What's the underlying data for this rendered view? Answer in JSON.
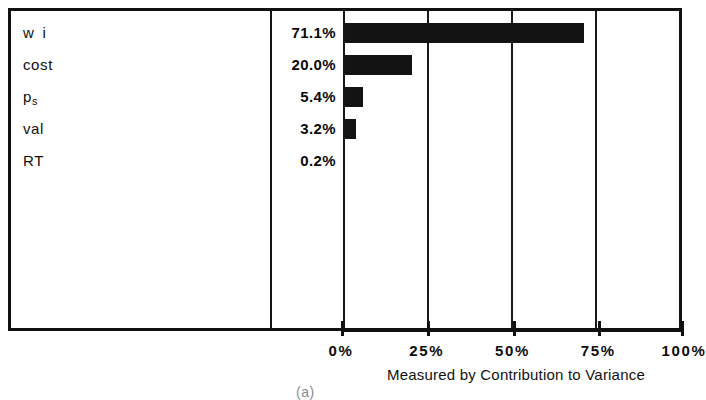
{
  "chart_data": {
    "type": "bar",
    "orientation": "horizontal",
    "title": "",
    "xlabel": "Measured by Contribution to Variance",
    "ylabel": "",
    "categories": [
      "wi",
      "cost",
      "p_s",
      "val",
      "RT"
    ],
    "category_labels_html": [
      "w i",
      "cost",
      "p<sub>s</sub>",
      "val",
      "RT"
    ],
    "values": [
      71.1,
      20.0,
      5.4,
      3.2,
      0.2
    ],
    "value_labels": [
      "71.1%",
      "20.0%",
      "5.4%",
      "3.2%",
      "0.2%"
    ],
    "xlim": [
      0,
      100
    ],
    "xticks": [
      0,
      25,
      50,
      75,
      100
    ],
    "xtick_labels": [
      "0%",
      "25%",
      "50%",
      "75%",
      "100%"
    ],
    "grid": true,
    "grid_axis": "x",
    "legend": false,
    "bar_color": "#131313",
    "frame_color": "#111111",
    "background": "#ffffff"
  },
  "rows": [
    {
      "label": "w i",
      "label_base": "w i",
      "label_sub": "",
      "value_label": "71.1%",
      "value": 71.1
    },
    {
      "label": "cost",
      "label_base": "cost",
      "label_sub": "",
      "value_label": "20.0%",
      "value": 20.0
    },
    {
      "label": "ps",
      "label_base": "p",
      "label_sub": "s",
      "value_label": "5.4%",
      "value": 5.4
    },
    {
      "label": "val",
      "label_base": "val",
      "label_sub": "",
      "value_label": "3.2%",
      "value": 3.2
    },
    {
      "label": "RT",
      "label_base": "RT",
      "label_sub": "",
      "value_label": "0.2%",
      "value": 0.2
    }
  ],
  "axis": {
    "caption": "Measured by Contribution to Variance",
    "ticks": [
      {
        "label": "0%",
        "value": 0
      },
      {
        "label": "25%",
        "value": 25
      },
      {
        "label": "50%",
        "value": 50
      },
      {
        "label": "75%",
        "value": 75
      },
      {
        "label": "100%",
        "value": 100
      }
    ]
  },
  "figure": {
    "tag": "(a)"
  }
}
